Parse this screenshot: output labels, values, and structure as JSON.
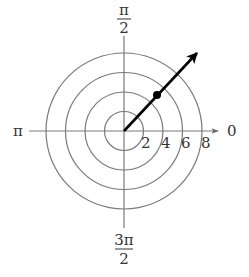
{
  "diagram": {
    "type": "polar-coordinate-plot",
    "center": {
      "x": 124,
      "y": 131
    },
    "px_per_unit": 9.75,
    "circles": [
      2,
      4,
      6,
      8
    ],
    "radial_tick_labels": [
      "2",
      "4",
      "6",
      "8"
    ],
    "angle_labels": {
      "right": "0",
      "top_numerator": "π",
      "top_denominator": "2",
      "left": "π",
      "bottom_numerator": "3π",
      "bottom_denominator": "2"
    },
    "plotted_point": {
      "r": 5,
      "theta": "π/4",
      "theta_deg": 45
    },
    "ray": {
      "theta": "π/4",
      "from_r": 0,
      "to_r": 10,
      "arrow": true
    },
    "colors": {
      "grid": "#7a7a7a",
      "ray": "#000000",
      "text": "#333333",
      "background": "#ffffff"
    }
  }
}
